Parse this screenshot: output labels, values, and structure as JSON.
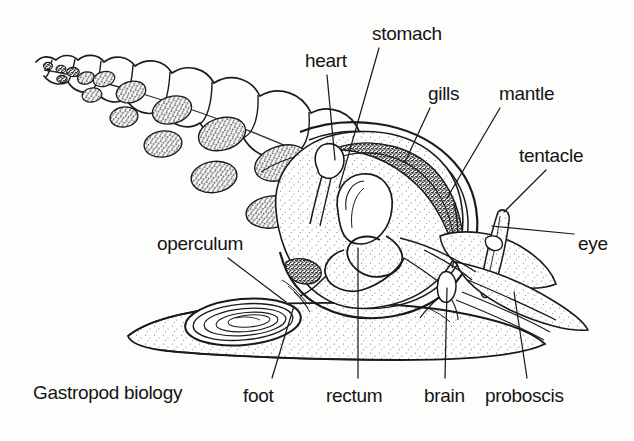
{
  "figure": {
    "caption": "Gastropod biology",
    "caption_pos": {
      "x": 33,
      "y": 383
    },
    "background_color": "#fdfdfc",
    "ink_color": "#141414",
    "tissue_fill": "#f2f0ec",
    "dark_tissue_fill": "#8a857c"
  },
  "labels": [
    {
      "id": "stomach",
      "text": "stomach",
      "x": 372,
      "y": 24,
      "leader": {
        "x1": 379,
        "y1": 48,
        "x2": 339,
        "y2": 188
      }
    },
    {
      "id": "heart",
      "text": "heart",
      "x": 305,
      "y": 51,
      "leader": {
        "x1": 327,
        "y1": 75,
        "x2": 335,
        "y2": 160
      }
    },
    {
      "id": "gills",
      "text": "gills",
      "x": 428,
      "y": 84,
      "leader": {
        "x1": 430,
        "y1": 108,
        "x2": 405,
        "y2": 160
      }
    },
    {
      "id": "mantle",
      "text": "mantle",
      "x": 499,
      "y": 84,
      "leader": {
        "x1": 500,
        "y1": 108,
        "x2": 448,
        "y2": 196
      }
    },
    {
      "id": "tentacle",
      "text": "tentacle",
      "x": 519,
      "y": 146,
      "leader": {
        "x1": 546,
        "y1": 170,
        "x2": 505,
        "y2": 210
      }
    },
    {
      "id": "eye",
      "text": "eye",
      "x": 580,
      "y": 238,
      "leader": {
        "x1": 578,
        "y1": 240,
        "x2": 493,
        "y2": 226
      }
    },
    {
      "id": "operculum",
      "text": "operculum",
      "x": 157,
      "y": 236,
      "leader": {
        "x1": 228,
        "y1": 260,
        "x2": 283,
        "y2": 300
      }
    },
    {
      "id": "foot",
      "text": "foot",
      "x": 243,
      "y": 386,
      "leader": {
        "x1": 272,
        "y1": 383,
        "x2": 294,
        "y2": 306
      }
    },
    {
      "id": "rectum",
      "text": "rectum",
      "x": 326,
      "y": 386,
      "leader": {
        "x1": 358,
        "y1": 383,
        "x2": 358,
        "y2": 248
      }
    },
    {
      "id": "brain",
      "text": "brain",
      "x": 424,
      "y": 386,
      "leader": {
        "x1": 445,
        "y1": 383,
        "x2": 447,
        "y2": 288
      }
    },
    {
      "id": "proboscis",
      "text": "proboscis",
      "x": 485,
      "y": 386,
      "leader": {
        "x1": 527,
        "y1": 383,
        "x2": 514,
        "y2": 292
      }
    }
  ],
  "shell": {
    "type": "cutaway-spire",
    "whorl_count": 11,
    "description": "coiled conical shell shown in cutaway with stippled visceral mass blobs inside each whorl"
  },
  "body": {
    "parts": [
      "foot",
      "operculum",
      "proboscis",
      "tentacle",
      "eye",
      "mantle",
      "gills",
      "heart",
      "stomach",
      "rectum",
      "brain"
    ]
  }
}
